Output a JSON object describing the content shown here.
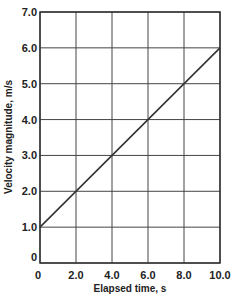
{
  "chart_data": {
    "type": "line",
    "title": "",
    "xlabel": "Elapsed time, s",
    "ylabel": "Velocity magnitude, m/s",
    "xlim": [
      0,
      10
    ],
    "ylim": [
      0,
      7
    ],
    "grid": true,
    "x_ticks": [
      "0",
      "2.0",
      "4.0",
      "6.0",
      "8.0",
      "10.0"
    ],
    "y_ticks": [
      "0",
      "1.0",
      "2.0",
      "3.0",
      "4.0",
      "5.0",
      "6.0",
      "7.0"
    ],
    "series": [
      {
        "name": "velocity",
        "x": [
          0,
          10
        ],
        "y": [
          1.0,
          6.0
        ]
      }
    ]
  }
}
